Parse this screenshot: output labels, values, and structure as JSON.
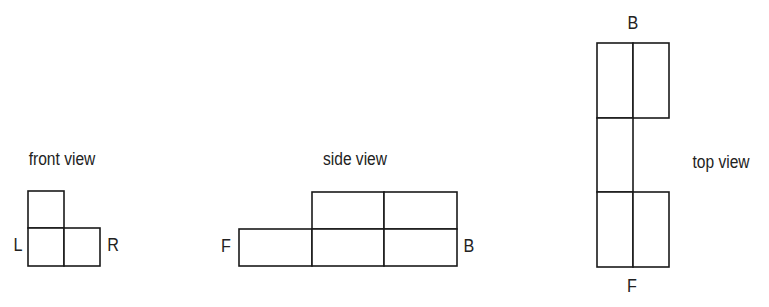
{
  "diagram": {
    "line_color": "#1a1a1a",
    "text_color": "#222222",
    "views": [
      {
        "name": "front view",
        "title": "front view",
        "left_label": "L",
        "right_label": "R",
        "grid": {
          "cols": 2,
          "rows": 2,
          "cells": [
            [
              1,
              0
            ],
            [
              1,
              1
            ]
          ]
        }
      },
      {
        "name": "side view",
        "title": "side view",
        "left_label": "F",
        "right_label": "B",
        "grid": {
          "cols": 3,
          "rows": 2,
          "cells": [
            [
              0,
              1,
              1
            ],
            [
              1,
              1,
              1
            ]
          ]
        }
      },
      {
        "name": "top view",
        "title": "top view",
        "top_label": "B",
        "bottom_label": "F",
        "grid": {
          "cols": 2,
          "rows": 3,
          "cells": [
            [
              1,
              1
            ],
            [
              1,
              0
            ],
            [
              1,
              1
            ]
          ]
        }
      }
    ]
  }
}
